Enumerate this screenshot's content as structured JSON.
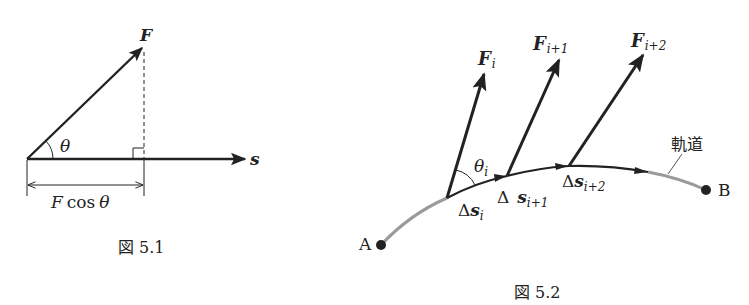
{
  "figure1": {
    "caption": "図 5.1",
    "force_label": "F",
    "displacement_label": "s",
    "angle_label": "θ",
    "projection_label_F": "F",
    "projection_label_func": "cos",
    "projection_label_theta": "θ"
  },
  "figure2": {
    "caption": "図 5.2",
    "start_label": "A",
    "end_label": "B",
    "path_label": "軌道",
    "angle_label": "θ",
    "angle_sub": "i",
    "forces": [
      {
        "main": "F",
        "sub": "i"
      },
      {
        "main": "F",
        "sub": "i+1"
      },
      {
        "main": "F",
        "sub": "i+2"
      }
    ],
    "displacements": [
      {
        "delta": "Δ",
        "main": "s",
        "sub": "i"
      },
      {
        "delta": "Δ",
        "main": "s",
        "sub": "i+1"
      },
      {
        "delta": "Δ",
        "main": "s",
        "sub": "i+2"
      }
    ]
  },
  "colors": {
    "ink": "#222222",
    "path_gray": "#9a9a9a"
  }
}
